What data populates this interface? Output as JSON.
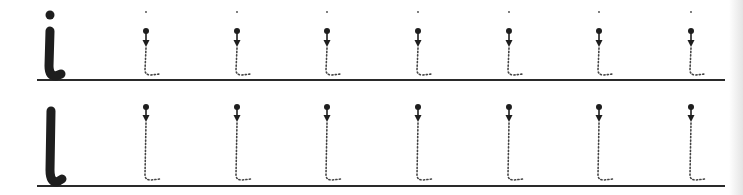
{
  "worksheet": {
    "title": "Handwriting practice: i and l",
    "rows": [
      {
        "letter": "i",
        "model_glyph": "i",
        "baseline_y": 80,
        "trace_count": 7,
        "trace_x": [
          146,
          237,
          327,
          418,
          509,
          599,
          691
        ],
        "has_dot": true
      },
      {
        "letter": "l",
        "model_glyph": "l",
        "baseline_y": 186,
        "trace_count": 7,
        "trace_x": [
          146,
          237,
          327,
          418,
          509,
          599,
          691
        ],
        "has_dot": false
      }
    ],
    "line_start_x": 37,
    "line_end_x": 725,
    "colors": {
      "ink": "#1e1e1e",
      "trace": "#444444",
      "line": "#2a2a2a",
      "paper": "#ffffff"
    }
  }
}
